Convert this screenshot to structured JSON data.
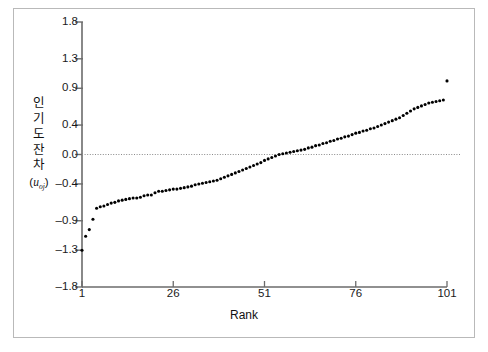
{
  "chart_data": {
    "type": "scatter",
    "title": "",
    "xlabel": "Rank",
    "ylabel": "인기도 잔차 (u_oj)",
    "ylabel_lines": [
      "인",
      "기",
      "도",
      "잔",
      "차"
    ],
    "ylabel_sub_pre": "(",
    "ylabel_sub_var": "u",
    "ylabel_sub_idx": "oj",
    "ylabel_sub_post": ")",
    "grid": false,
    "legend": "none",
    "zero_reference_line": 0.0,
    "xlim": [
      1,
      101
    ],
    "ylim": [
      -1.8,
      1.8
    ],
    "xticks": [
      1,
      26,
      51,
      76,
      101
    ],
    "xtick_labels": [
      "1",
      "26",
      "51",
      "76",
      "101"
    ],
    "yticks": [
      -1.8,
      -1.3,
      -0.9,
      -0.4,
      0.0,
      0.4,
      0.9,
      1.3,
      1.8
    ],
    "ytick_labels": [
      "-1.8",
      "-1.3",
      "-0.9",
      "-0.4",
      "0.0",
      "0.4",
      "0.9",
      "1.3",
      "1.8"
    ],
    "point_color": "#000000",
    "point_size": 3.1,
    "axis_color": "#6b6b6b",
    "zero_line_color": "#8a8a8a",
    "x": [
      1,
      2,
      3,
      4,
      5,
      6,
      7,
      8,
      9,
      10,
      11,
      12,
      13,
      14,
      15,
      16,
      17,
      18,
      19,
      20,
      21,
      22,
      23,
      24,
      25,
      26,
      27,
      28,
      29,
      30,
      31,
      32,
      33,
      34,
      35,
      36,
      37,
      38,
      39,
      40,
      41,
      42,
      43,
      44,
      45,
      46,
      47,
      48,
      49,
      50,
      51,
      52,
      53,
      54,
      55,
      56,
      57,
      58,
      59,
      60,
      61,
      62,
      63,
      64,
      65,
      66,
      67,
      68,
      69,
      70,
      71,
      72,
      73,
      74,
      75,
      76,
      77,
      78,
      79,
      80,
      81,
      82,
      83,
      84,
      85,
      86,
      87,
      88,
      89,
      90,
      91,
      92,
      93,
      94,
      95,
      96,
      97,
      98,
      99,
      100,
      101
    ],
    "y": [
      -1.3,
      -1.11,
      -1.02,
      -0.88,
      -0.73,
      -0.71,
      -0.7,
      -0.68,
      -0.66,
      -0.65,
      -0.63,
      -0.62,
      -0.61,
      -0.6,
      -0.59,
      -0.59,
      -0.58,
      -0.56,
      -0.55,
      -0.55,
      -0.52,
      -0.5,
      -0.5,
      -0.49,
      -0.48,
      -0.47,
      -0.47,
      -0.46,
      -0.45,
      -0.44,
      -0.43,
      -0.41,
      -0.4,
      -0.39,
      -0.38,
      -0.37,
      -0.36,
      -0.35,
      -0.33,
      -0.31,
      -0.29,
      -0.27,
      -0.25,
      -0.23,
      -0.21,
      -0.19,
      -0.17,
      -0.15,
      -0.13,
      -0.11,
      -0.08,
      -0.06,
      -0.04,
      -0.02,
      0.0,
      0.01,
      0.02,
      0.03,
      0.04,
      0.05,
      0.06,
      0.07,
      0.09,
      0.1,
      0.12,
      0.13,
      0.15,
      0.16,
      0.18,
      0.19,
      0.21,
      0.22,
      0.24,
      0.25,
      0.27,
      0.29,
      0.3,
      0.32,
      0.33,
      0.35,
      0.36,
      0.38,
      0.4,
      0.42,
      0.44,
      0.46,
      0.48,
      0.5,
      0.53,
      0.56,
      0.59,
      0.62,
      0.64,
      0.66,
      0.68,
      0.7,
      0.71,
      0.72,
      0.73,
      0.74,
      1.0,
      1.38,
      1.57
    ]
  }
}
